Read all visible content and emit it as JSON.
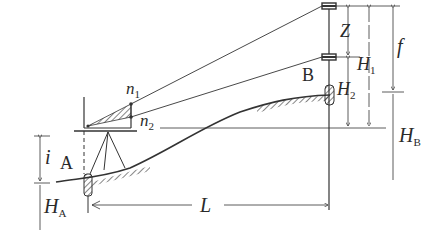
{
  "diagram": {
    "type": "trigonometric-leveling-schematic",
    "colors": {
      "line": "#333333",
      "ink": "#2a2a2a",
      "background": "#ffffff"
    },
    "points": {
      "A": {
        "label": "A"
      },
      "B": {
        "label": "B"
      }
    },
    "labels": {
      "n1": {
        "base": "n",
        "sub": "1"
      },
      "n2": {
        "base": "n",
        "sub": "2"
      },
      "Z": "Z",
      "H1": {
        "base": "H",
        "sub": "1"
      },
      "H2": {
        "base": "H",
        "sub": "2"
      },
      "f": "f",
      "HB": {
        "base": "H",
        "sub": "B"
      },
      "i": "i",
      "HA": {
        "base": "H",
        "sub": "A"
      },
      "L": "L"
    }
  }
}
